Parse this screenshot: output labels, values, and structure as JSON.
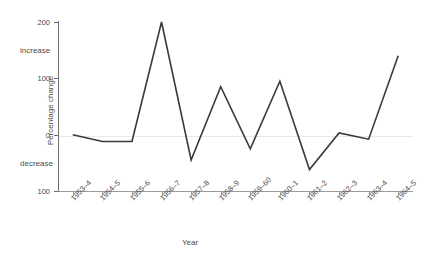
{
  "chart_data": {
    "type": "line",
    "title": "",
    "xlabel": "Year",
    "ylabel": "Percentage change",
    "categories": [
      "1953–4",
      "1954–5",
      "1955–6",
      "1956–7",
      "1957–8",
      "1958–9",
      "1959–60",
      "1960–1",
      "1961–2",
      "1962–3",
      "1963–4",
      "1964–5"
    ],
    "values": [
      0,
      -12,
      -12,
      200,
      -45,
      85,
      -25,
      95,
      -62,
      3,
      -8,
      140
    ],
    "series": [
      {
        "name": "Percentage change",
        "values": [
          0,
          -12,
          -12,
          200,
          -45,
          85,
          -25,
          95,
          -62,
          3,
          -8,
          140
        ]
      }
    ],
    "ylim": [
      -100,
      200
    ],
    "y_ticks": [
      200,
      100,
      0,
      -100
    ],
    "y_tick_labels": [
      "200",
      "100",
      "0",
      "100"
    ],
    "axis_direction_labels": [
      {
        "text": "increase",
        "value": 150
      },
      {
        "text": "decrease",
        "value": -50
      }
    ],
    "grid": "zero-line-only",
    "legend": "none",
    "line_color": "#3a3a3a",
    "axis_color": "#7a7a7a",
    "grid_color": "#e8e8e8",
    "text_color": "#4c4c4c",
    "background_color": "#ffffff"
  }
}
